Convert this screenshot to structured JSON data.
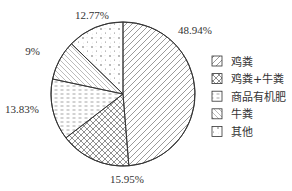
{
  "chart_data": {
    "type": "pie",
    "title": "",
    "categories": [
      "鸡粪",
      "鸡粪+牛粪",
      "商品有机肥",
      "牛粪",
      "其他"
    ],
    "values": [
      48.94,
      15.95,
      13.83,
      9,
      12.77
    ],
    "value_labels": [
      "48.94%",
      "15.95%",
      "13.83%",
      "9%",
      "12.77%"
    ],
    "patterns": [
      "diagonal-forward",
      "crosshatch",
      "dashed-horizontal",
      "diagonal-backward",
      "dotted"
    ],
    "start_angle": "12 o'clock",
    "direction": "clockwise",
    "legend": {
      "position": "right",
      "entries": [
        "鸡粪",
        "鸡粪+牛粪",
        "商品有机肥",
        "牛粪",
        "其他"
      ]
    }
  },
  "colors": {
    "stroke": "#333333",
    "fill": "#ffffff"
  }
}
